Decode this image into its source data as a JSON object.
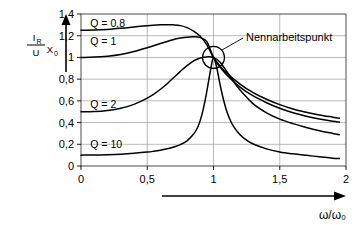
{
  "chart_data": {
    "type": "line",
    "title": "",
    "xlabel": "ω/ω₀",
    "ylabel_parts": {
      "numerator": "I",
      "numerator_sub": "R",
      "denominator": "U",
      "factor": "X",
      "factor_sub": "0"
    },
    "xlim": [
      0,
      2
    ],
    "ylim": [
      0,
      1.4
    ],
    "grid": true,
    "legend_position": "inline-left",
    "x_tick_labels": [
      "0",
      "0,5",
      "1",
      "1,5",
      "2"
    ],
    "x_tick_values": [
      0,
      0.5,
      1,
      1.5,
      2
    ],
    "y_tick_labels": [
      "0",
      "0,2",
      "0,4",
      "0,6",
      "0,8",
      "1",
      "1,2",
      "1,4"
    ],
    "y_tick_values": [
      0,
      0.2,
      0.4,
      0.6,
      0.8,
      1.0,
      1.2,
      1.4
    ],
    "annotations": [
      {
        "name": "nennarbeitspunkt",
        "text": "Nennarbeitspunkt",
        "point_x": 1.0,
        "point_y": 1.0,
        "marker": "circle"
      }
    ],
    "series": [
      {
        "name": "Q = 0,8",
        "label": "Q = 0,8",
        "label_x": 0.07,
        "label_y": 1.32,
        "x": [
          0,
          0.1,
          0.2,
          0.3,
          0.4,
          0.5,
          0.6,
          0.65,
          0.7,
          0.75,
          0.8,
          0.85,
          0.9,
          0.95,
          1.0,
          1.05,
          1.1,
          1.2,
          1.3,
          1.4,
          1.5,
          1.6,
          1.7,
          1.8,
          1.9,
          1.95
        ],
        "y": [
          1.25,
          1.252,
          1.258,
          1.268,
          1.28,
          1.292,
          1.3,
          1.302,
          1.3,
          1.293,
          1.275,
          1.243,
          1.195,
          1.115,
          1.0,
          0.92,
          0.855,
          0.755,
          0.675,
          0.615,
          0.565,
          0.525,
          0.495,
          0.47,
          0.45,
          0.44
        ]
      },
      {
        "name": "Q = 1",
        "label": "Q = 1",
        "label_x": 0.07,
        "label_y": 1.155,
        "x": [
          0,
          0.1,
          0.2,
          0.3,
          0.4,
          0.5,
          0.6,
          0.7,
          0.75,
          0.8,
          0.85,
          0.9,
          0.95,
          1.0,
          1.05,
          1.1,
          1.2,
          1.3,
          1.4,
          1.5,
          1.6,
          1.7,
          1.8,
          1.9,
          1.95
        ],
        "y": [
          1.0,
          1.003,
          1.012,
          1.028,
          1.055,
          1.09,
          1.128,
          1.165,
          1.178,
          1.187,
          1.19,
          1.182,
          1.145,
          1.0,
          0.91,
          0.838,
          0.727,
          0.645,
          0.583,
          0.532,
          0.49,
          0.458,
          0.432,
          0.412,
          0.405
        ]
      },
      {
        "name": "Q = 2",
        "label": "Q = 2",
        "label_x": 0.07,
        "label_y": 0.575,
        "x": [
          0,
          0.1,
          0.2,
          0.3,
          0.4,
          0.5,
          0.55,
          0.6,
          0.65,
          0.7,
          0.75,
          0.8,
          0.85,
          0.9,
          0.95,
          1.0,
          1.05,
          1.1,
          1.15,
          1.2,
          1.3,
          1.4,
          1.5,
          1.6,
          1.7,
          1.8,
          1.9,
          1.95
        ],
        "y": [
          0.5,
          0.502,
          0.512,
          0.532,
          0.568,
          0.625,
          0.663,
          0.707,
          0.758,
          0.815,
          0.872,
          0.925,
          0.968,
          0.995,
          1.005,
          1.0,
          0.955,
          0.87,
          0.78,
          0.7,
          0.572,
          0.49,
          0.432,
          0.39,
          0.355,
          0.325,
          0.3,
          0.288
        ]
      },
      {
        "name": "Q = 10",
        "label": "Q = 10",
        "label_x": 0.07,
        "label_y": 0.205,
        "x": [
          0,
          0.1,
          0.2,
          0.3,
          0.4,
          0.5,
          0.55,
          0.6,
          0.65,
          0.7,
          0.75,
          0.8,
          0.85,
          0.88,
          0.9,
          0.92,
          0.94,
          0.96,
          0.98,
          1.0,
          1.02,
          1.04,
          1.06,
          1.08,
          1.1,
          1.12,
          1.15,
          1.2,
          1.25,
          1.3,
          1.4,
          1.5,
          1.6,
          1.7,
          1.8,
          1.9,
          1.95
        ],
        "y": [
          0.1,
          0.101,
          0.104,
          0.109,
          0.117,
          0.128,
          0.136,
          0.146,
          0.158,
          0.175,
          0.197,
          0.232,
          0.295,
          0.355,
          0.42,
          0.51,
          0.625,
          0.76,
          0.9,
          1.0,
          0.93,
          0.81,
          0.69,
          0.59,
          0.505,
          0.44,
          0.368,
          0.288,
          0.238,
          0.203,
          0.158,
          0.13,
          0.112,
          0.098,
          0.085,
          0.072,
          0.068
        ]
      }
    ]
  },
  "plot_geometry": {
    "left": 81,
    "right": 346,
    "top": 14,
    "bottom": 166
  }
}
